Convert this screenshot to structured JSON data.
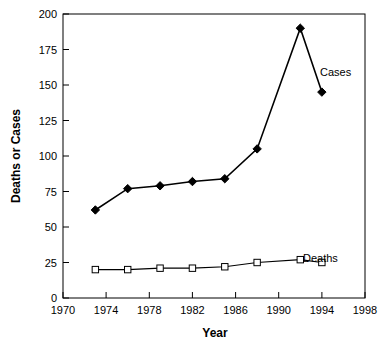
{
  "chart_data": {
    "type": "line",
    "title": "",
    "xlabel": "Year",
    "ylabel": "Deaths or Cases",
    "xlim": [
      1970,
      1998
    ],
    "ylim": [
      0,
      200
    ],
    "xticks": [
      1970,
      1974,
      1978,
      1982,
      1986,
      1990,
      1994,
      1998
    ],
    "yticks": [
      0,
      25,
      50,
      75,
      100,
      125,
      150,
      175,
      200
    ],
    "grid": false,
    "legend_position": "inline-right",
    "series": [
      {
        "name": "Cases",
        "marker": "filled-diamond",
        "x": [
          1973,
          1976,
          1979,
          1982,
          1985,
          1988,
          1992,
          1994
        ],
        "values": [
          62,
          77,
          79,
          82,
          84,
          105,
          190,
          145
        ]
      },
      {
        "name": "Deaths",
        "marker": "open-square",
        "x": [
          1973,
          1976,
          1979,
          1982,
          1985,
          1988,
          1992,
          1994
        ],
        "values": [
          20,
          20,
          21,
          21,
          22,
          25,
          27,
          25
        ]
      }
    ],
    "annotations": [
      {
        "text": "Cases",
        "x": 1994,
        "y": 157
      },
      {
        "text": "Deaths",
        "x": 1992,
        "y": 42
      }
    ]
  },
  "axis": {
    "y_title": "Deaths or Cases",
    "x_title": "Year",
    "y_tick_labels": [
      "0",
      "25",
      "50",
      "75",
      "100",
      "125",
      "150",
      "175",
      "200"
    ],
    "x_tick_labels": [
      "1970",
      "1974",
      "1978",
      "1982",
      "1986",
      "1990",
      "1994",
      "1998"
    ]
  },
  "labels": {
    "cases": "Cases",
    "deaths": "Deaths"
  },
  "colors": {
    "line": "#000000",
    "background": "#ffffff",
    "marker_fill_cases": "#000000",
    "marker_fill_deaths": "#ffffff"
  }
}
